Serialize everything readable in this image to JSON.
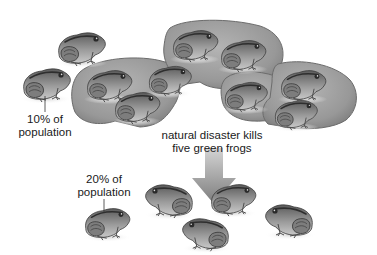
{
  "diagram": {
    "topic": "bottleneck effect on frog population",
    "labels": {
      "before_percentage_line1": "10% of",
      "before_percentage_line2": "population",
      "event_line1": "natural disaster kills",
      "event_line2": "five green frogs",
      "after_percentage_line1": "20% of",
      "after_percentage_line2": "population"
    },
    "colors": {
      "background": "#ffffff",
      "lily_pad_fill": "#9a9a9a",
      "lily_pad_edge": "#6e6e6e",
      "frog_body": "#8a8a8a",
      "frog_dark": "#3c3c3c",
      "arrow": "#8f8f8f",
      "text": "#1a1a1a"
    },
    "population_before": {
      "total_frogs": 10,
      "on_lily_pads": 8,
      "off_lily_pads": 2
    },
    "population_after": {
      "total_frogs": 5
    }
  }
}
